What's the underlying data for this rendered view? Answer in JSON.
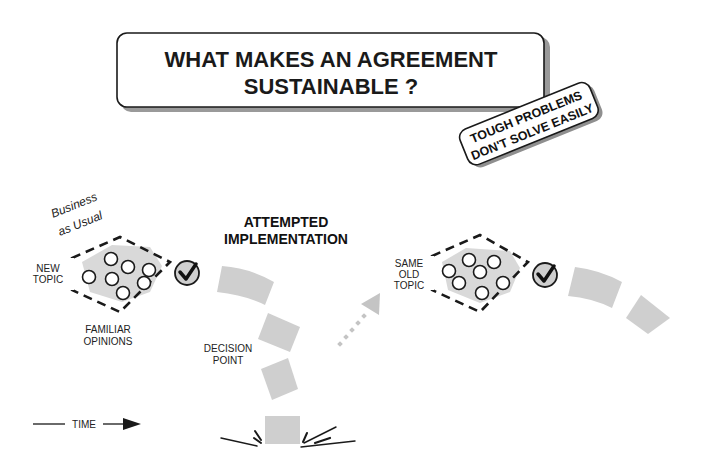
{
  "title": {
    "line1": "WHAT MAKES AN AGREEMENT",
    "line2": "SUSTAINABLE ?"
  },
  "tag": {
    "line1": "TOUGH PROBLEMS",
    "line2": "DON'T SOLVE EASILY"
  },
  "left_cluster": {
    "caption_line1": "Business",
    "caption_line2": "as Usual",
    "topic_line1": "NEW",
    "topic_line2": "TOPIC",
    "opinions_line1": "FAMILIAR",
    "opinions_line2": "OPINIONS",
    "check_icon": "check-circle-icon"
  },
  "middle": {
    "heading_line1": "ATTEMPTED",
    "heading_line2": "IMPLEMENTATION",
    "decision_line1": "DECISION",
    "decision_line2": "POINT"
  },
  "right_cluster": {
    "topic_line1": "SAME",
    "topic_line2": "OLD",
    "topic_line3": "TOPIC",
    "check_icon": "check-circle-icon"
  },
  "timeline": {
    "label": "TIME"
  },
  "colors": {
    "ink": "#1a1a1a",
    "fill_gray": "#d9d9d9",
    "segment_gray": "#cfcfcf",
    "background": "#ffffff"
  }
}
